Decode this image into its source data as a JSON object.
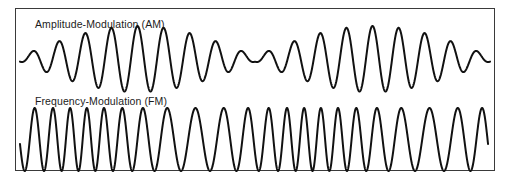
{
  "figure": {
    "background_color": "#ffffff",
    "border_color": "#3a3a3a",
    "trace_color": "#111111"
  },
  "panels": [
    {
      "id": "am",
      "label": "Amplitude-Modulation (AM)",
      "waveform": "amplitude-modulated-carrier"
    },
    {
      "id": "fm",
      "label": "Frequency-Modulation (FM)",
      "waveform": "frequency-modulated-carrier"
    }
  ],
  "chart_data": [
    {
      "type": "line",
      "title": "Amplitude-Modulation (AM)",
      "xlabel": "",
      "ylabel": "",
      "grid": false,
      "legend": "none",
      "xlim": [
        0,
        1
      ],
      "ylim": [
        -1,
        1
      ],
      "description": "Amplitude-modulated carrier: constant carrier frequency with a slowly varying sinusoidal envelope producing two beat packets separated by a low-amplitude null region.",
      "carrier_cycles": 18,
      "envelope_cycles": 2,
      "envelope_min": 0.08,
      "envelope_max": 1.0,
      "series": [
        {
          "name": "AM signal",
          "formula": "y = (0.08 + 0.92*|sin(2*pi*1*x)|) * sin(2*pi*18*x)",
          "color": "#111111"
        },
        {
          "name": "envelope peaks (x, amplitude)",
          "points": [
            [
              0.0,
              0.1
            ],
            [
              0.06,
              0.22
            ],
            [
              0.12,
              0.48
            ],
            [
              0.18,
              0.78
            ],
            [
              0.25,
              1.0
            ],
            [
              0.32,
              0.78
            ],
            [
              0.38,
              0.48
            ],
            [
              0.44,
              0.22
            ],
            [
              0.5,
              0.08
            ],
            [
              0.56,
              0.22
            ],
            [
              0.62,
              0.48
            ],
            [
              0.68,
              0.78
            ],
            [
              0.75,
              1.0
            ],
            [
              0.82,
              0.78
            ],
            [
              0.88,
              0.48
            ],
            [
              0.94,
              0.22
            ],
            [
              1.0,
              0.1
            ]
          ]
        }
      ]
    },
    {
      "type": "line",
      "title": "Frequency-Modulation (FM)",
      "xlabel": "",
      "ylabel": "",
      "grid": false,
      "legend": "none",
      "xlim": [
        0,
        1
      ],
      "ylim": [
        -1,
        1
      ],
      "description": "Frequency-modulated carrier: constant amplitude with instantaneous frequency varying sinusoidally, fast at the edges and slow near the middle of each modulation period.",
      "amplitude": 1.0,
      "carrier_frequency": 22,
      "frequency_deviation": 12,
      "modulation_cycles": 2,
      "series": [
        {
          "name": "FM signal",
          "formula": "y = sin(2*pi*22*x + (12/2)*sin(2*pi*2*x))",
          "color": "#111111"
        },
        {
          "name": "instantaneous frequency (x, cycles-per-unit)",
          "points": [
            [
              0.0,
              34
            ],
            [
              0.12,
              30
            ],
            [
              0.25,
              22
            ],
            [
              0.38,
              13
            ],
            [
              0.5,
              10
            ],
            [
              0.62,
              13
            ],
            [
              0.75,
              22
            ],
            [
              0.88,
              30
            ],
            [
              1.0,
              34
            ]
          ]
        }
      ]
    }
  ]
}
